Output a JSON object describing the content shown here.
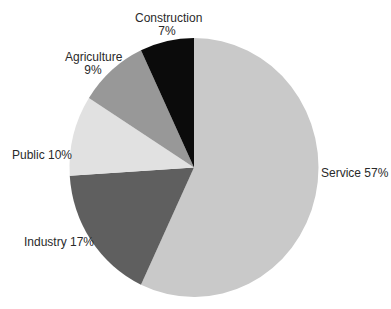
{
  "chart_data": {
    "type": "pie",
    "title": "",
    "start_angle_deg": 0,
    "direction": "clockwise",
    "categories": [
      "Service",
      "Industry",
      "Public",
      "Agriculture",
      "Construction"
    ],
    "values": [
      57,
      17,
      10,
      9,
      7
    ],
    "unit": "%",
    "colors": [
      "#c9c9c9",
      "#5f5f5f",
      "#e1e1e1",
      "#989898",
      "#0b0b0b"
    ],
    "slices": [
      {
        "name": "Service",
        "value": 57,
        "color": "#c9c9c9",
        "label_line1": "Service 57%",
        "label_line2": ""
      },
      {
        "name": "Industry",
        "value": 17,
        "color": "#5f5f5f",
        "label_line1": "Industry 17%",
        "label_line2": ""
      },
      {
        "name": "Public",
        "value": 10,
        "color": "#e1e1e1",
        "label_line1": "Public 10%",
        "label_line2": ""
      },
      {
        "name": "Agriculture",
        "value": 9,
        "color": "#989898",
        "label_line1": "Agriculture",
        "label_line2": "9%"
      },
      {
        "name": "Construction",
        "value": 7,
        "color": "#0b0b0b",
        "label_line1": "Construction",
        "label_line2": "7%"
      }
    ],
    "legend": "none",
    "labels_outside": true
  }
}
